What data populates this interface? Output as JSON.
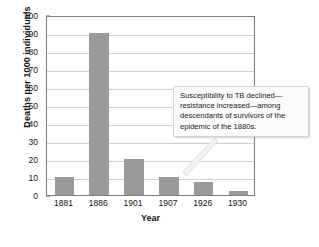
{
  "chart_data": {
    "type": "bar",
    "title": "",
    "xlabel": "Year",
    "ylabel": "Deaths per 1000 individuals",
    "categories": [
      "1881",
      "1886",
      "1901",
      "1907",
      "1926",
      "1930"
    ],
    "values": [
      10,
      90,
      20,
      10,
      7,
      2
    ],
    "ylim": [
      0,
      100
    ],
    "yticks": [
      0,
      10,
      20,
      30,
      40,
      50,
      60,
      70,
      80,
      90,
      100
    ],
    "ytick_labels": [
      "0",
      "10",
      "20",
      "30",
      "40",
      "50",
      "60",
      "70",
      "80",
      "90",
      "100"
    ],
    "grid": true,
    "legend": false,
    "bar_color": "#9a9a9a",
    "grid_color": "#cfcfcf",
    "frame_color": "#7c7c7c",
    "annotations": [
      {
        "name": "susceptibility-callout",
        "text": "Susceptibility to TB declined—resistance increased—among descendants of survivors of the epidemic of the 1880s.",
        "points_to": "1886"
      }
    ]
  },
  "figure": {
    "background": "#ffffff",
    "text_color": "#111111"
  }
}
